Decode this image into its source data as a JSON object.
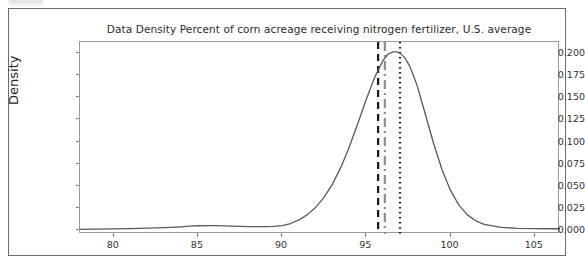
{
  "figure": {
    "title": "Data Density Percent of corn acreage receiving nitrogen fertilizer, U.S. average",
    "y_axis_title": "Density"
  },
  "chart_data": {
    "type": "line",
    "title": "Data Density Percent of corn acreage receiving nitrogen fertilizer, U.S. average",
    "xlabel": "",
    "ylabel": "Density",
    "xlim": [
      78.0,
      106.5
    ],
    "ylim": [
      -0.004,
      0.212
    ],
    "grid": false,
    "legend": null,
    "x_ticks": [
      80,
      85,
      90,
      95,
      100,
      105
    ],
    "x_tick_labels": [
      "80",
      "85",
      "90",
      "95",
      "100",
      "105"
    ],
    "y_ticks": [
      0.0,
      0.025,
      0.05,
      0.075,
      0.1,
      0.125,
      0.15,
      0.175,
      0.2
    ],
    "y_tick_labels": [
      "0.000",
      "0.025",
      "0.050",
      "0.075",
      "0.100",
      "0.125",
      "0.150",
      "0.175",
      "0.200"
    ],
    "series": [
      {
        "name": "density",
        "color": "#5a5a5a",
        "linestyle": "solid",
        "x": [
          78.0,
          79.0,
          80.0,
          81.0,
          82.0,
          83.0,
          84.0,
          84.5,
          85.0,
          85.5,
          86.0,
          86.5,
          87.0,
          88.0,
          89.0,
          89.5,
          90.0,
          90.5,
          91.0,
          91.5,
          92.0,
          92.5,
          93.0,
          93.5,
          94.0,
          94.5,
          95.0,
          95.5,
          96.0,
          96.3,
          96.6,
          96.8,
          97.0,
          97.3,
          97.6,
          98.0,
          98.5,
          99.0,
          99.5,
          100.0,
          100.5,
          101.0,
          101.5,
          102.0,
          103.0,
          104.0,
          105.0,
          106.0,
          106.5
        ],
        "y": [
          0.0012,
          0.0015,
          0.0018,
          0.0021,
          0.0025,
          0.0031,
          0.0041,
          0.0048,
          0.0053,
          0.0055,
          0.0054,
          0.0051,
          0.0048,
          0.0044,
          0.0043,
          0.0046,
          0.0055,
          0.0078,
          0.0118,
          0.0178,
          0.0262,
          0.0375,
          0.0525,
          0.0715,
          0.0945,
          0.1205,
          0.1475,
          0.1725,
          0.1915,
          0.1985,
          0.2008,
          0.201,
          0.1995,
          0.194,
          0.184,
          0.164,
          0.131,
          0.0975,
          0.068,
          0.045,
          0.0285,
          0.0175,
          0.0108,
          0.0068,
          0.0035,
          0.0024,
          0.002,
          0.0019,
          0.0019
        ]
      }
    ],
    "reference_lines": [
      {
        "name": "mean-line",
        "x": 95.7,
        "color": "#1a1a1a",
        "linestyle": "dashed",
        "linewidth": 2.2
      },
      {
        "name": "median-line",
        "x": 96.1,
        "color": "#8e8e8e",
        "linestyle": "dashdot",
        "linewidth": 2.2
      },
      {
        "name": "mode-line",
        "x": 97.0,
        "color": "#1a1a1a",
        "linestyle": "dotted",
        "linewidth": 2.2
      }
    ]
  }
}
